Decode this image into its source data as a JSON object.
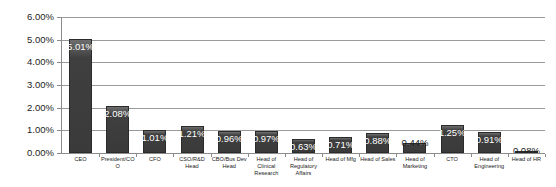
{
  "chart_data": {
    "type": "bar",
    "title": "",
    "xlabel": "",
    "ylabel": "",
    "ylim": [
      0,
      6
    ],
    "ytick_labels": [
      "0.00%",
      "1.00%",
      "2.00%",
      "3.00%",
      "4.00%",
      "5.00%",
      "6.00%"
    ],
    "ytick_values": [
      0,
      1,
      2,
      3,
      4,
      5,
      6
    ],
    "grid": true,
    "legend": "none",
    "bar_color": "#3f3f3f",
    "data_label_color": "#ffffff",
    "categories": [
      "CEO",
      "President/COO",
      "CFO",
      "CSO/R&D Head",
      "CBO/Bus Dev Head",
      "Head of Clinical Research",
      "Head of Regulatory Affairs",
      "Head of Mfg",
      "Head of Sales",
      "Head of Marketing",
      "CTO",
      "Head of Engineering",
      "Head of HR"
    ],
    "values": [
      5.01,
      2.08,
      1.01,
      1.21,
      0.96,
      0.97,
      0.63,
      0.71,
      0.88,
      0.44,
      1.25,
      0.91,
      0.08
    ],
    "data_labels": [
      "5.01%",
      "2.08%",
      "1.01%",
      "1.21%",
      "0.96%",
      "0.97%",
      "0.63%",
      "0.71%",
      "0.88%",
      "0.44%",
      "1.25%",
      "0.91%",
      "0.08%"
    ]
  }
}
